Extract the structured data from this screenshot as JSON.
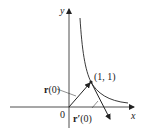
{
  "diagram": {
    "axes": {
      "x_label": "x",
      "y_label": "y",
      "origin_label": "0"
    },
    "curve": {
      "description": "hyperbola y = 1/x in first quadrant"
    },
    "point": {
      "label": "(1, 1)"
    },
    "vectors": [
      {
        "name": "position-vector",
        "label_main": "r",
        "label_arg": "(0)"
      },
      {
        "name": "tangent-vector",
        "label_main": "r′",
        "label_arg": "(0)"
      }
    ],
    "colors": {
      "ink": "#222222",
      "background": "#ffffff"
    }
  }
}
